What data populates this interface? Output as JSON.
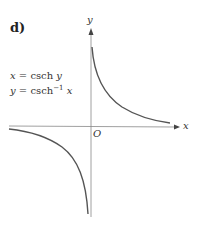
{
  "panel_label": "d)",
  "equations": {
    "line1": {
      "lhs": "x",
      "eq": " = ",
      "fn": "csch",
      "arg": " y"
    },
    "line2": {
      "lhs": "y",
      "eq": " = ",
      "fn": "csch",
      "sup": "−1",
      "arg": " x"
    }
  },
  "axes": {
    "x_label": "x",
    "y_label": "y",
    "origin_label": "O"
  },
  "colors": {
    "curve": "#555555",
    "axis": "#888888"
  }
}
